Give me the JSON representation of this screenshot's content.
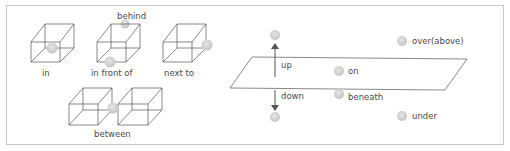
{
  "diagram": {
    "colors": {
      "frame": "#c8c8c8",
      "box_line": "#3a3a3a",
      "ball": "#cfcfcf",
      "ball_edge": "#bdbdbd",
      "arrow": "#555555",
      "text": "#4a4a4a"
    },
    "box_labels": {
      "in": "in",
      "behind": "behind",
      "in_front_of": "in front of",
      "next_to": "next to",
      "between": "between"
    },
    "plane_labels": {
      "up": "up",
      "down": "down",
      "on": "on",
      "beneath": "beneath",
      "over": "over(above)",
      "under": "under"
    }
  }
}
